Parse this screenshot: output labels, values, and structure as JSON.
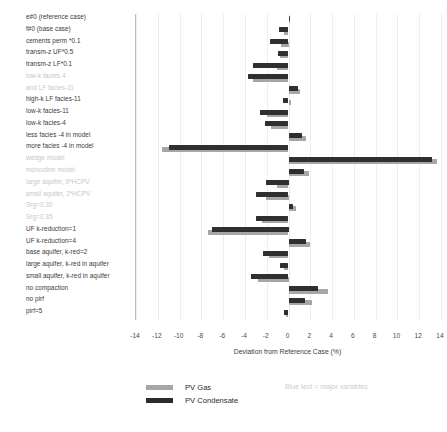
{
  "chart_data": {
    "type": "bar",
    "orientation": "horizontal",
    "title": "",
    "xlabel": "Deviation from Reference Case (%)",
    "ylabel": "",
    "xlim": [
      -14,
      14
    ],
    "xticks": [
      -14,
      -12,
      -10,
      -8,
      -6,
      -4,
      -2,
      0,
      2,
      4,
      6,
      8,
      10,
      12,
      14
    ],
    "grid": true,
    "legend_position": "bottom-left",
    "note": "Blue text = major variables",
    "colors": {
      "pv_gas": "#a6a6a6",
      "pv_condensate": "#2f2f2f",
      "minor_label": "#c3c8cf",
      "major_label": "#3a3a3a"
    },
    "categories": [
      "e#0 (reference case)",
      "f#0 (base case)",
      "cements perm *0.1",
      "transm-z UF*0.5",
      "transm-z LF*0.1",
      "low-k facies-4",
      "and LF facies-11",
      "high-k LF facies-11",
      "low-k facies-11",
      "low-k facies-4",
      "less facies -4 in model",
      "more facies -4 in model",
      "wedge model",
      "monocline model",
      "large aquifer, 9*HCPV",
      "small aquifer, 2*HCPV",
      "Srg=0.30",
      "Srg=0.35",
      "UF k-reduction=1",
      "UF k-reduction=4",
      "base aquifer, k-red=2",
      "large aquifer, k-red in aquifer",
      "small aquifer, k-red in aquifer",
      "no compaction",
      "no pirf",
      "pirf=5"
    ],
    "category_emphasis": [
      "major",
      "major",
      "major",
      "major",
      "major",
      "minor",
      "minor",
      "major",
      "major",
      "major",
      "major",
      "major",
      "minor",
      "minor",
      "minor",
      "minor",
      "minor",
      "minor",
      "major",
      "major",
      "major",
      "major",
      "major",
      "major",
      "major",
      "major"
    ],
    "series": [
      {
        "name": "PV Gas",
        "color": "#a6a6a6",
        "values": [
          0.0,
          -0.4,
          -0.7,
          -0.8,
          -1.1,
          -3.3,
          1.1,
          0.2,
          -2.0,
          -1.6,
          1.6,
          -11.6,
          13.6,
          1.9,
          -1.1,
          -2.1,
          0.7,
          -2.4,
          -7.4,
          2.0,
          -1.8,
          -0.4,
          -2.8,
          3.6,
          2.2,
          -0.2
        ]
      },
      {
        "name": "PV Condensate",
        "color": "#2f2f2f",
        "values": [
          0.1,
          -0.9,
          -1.7,
          -1.0,
          -3.3,
          -3.7,
          0.9,
          -0.5,
          -2.6,
          -2.2,
          1.2,
          -11.0,
          13.2,
          1.4,
          -2.1,
          -3.0,
          0.4,
          -3.0,
          -7.0,
          1.6,
          -2.3,
          -0.8,
          -3.4,
          2.7,
          1.5,
          -0.4
        ]
      }
    ]
  },
  "axis": {
    "tick_labels": [
      "-14",
      "-12",
      "-10",
      "-8",
      "-6",
      "-4",
      "-2",
      "0",
      "2",
      "4",
      "6",
      "8",
      "10",
      "12",
      "14"
    ],
    "title": "Deviation from Reference Case (%)"
  },
  "legend": {
    "items": [
      {
        "label": "PV Gas",
        "key": "gas"
      },
      {
        "label": "PV Condensate",
        "key": "cond"
      }
    ],
    "note": "Blue text = major variables"
  }
}
